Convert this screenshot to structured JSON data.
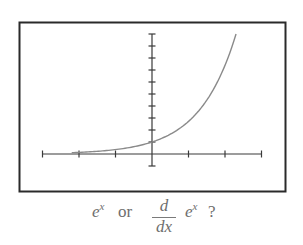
{
  "chart_data": {
    "type": "line",
    "title": "",
    "xlabel": "",
    "ylabel": "",
    "function": "y = e^x",
    "series": [
      {
        "name": "e^x",
        "x": [
          -3,
          -2,
          -1,
          -0.5,
          0,
          0.5,
          1,
          1.5,
          2,
          2.3
        ],
        "y": [
          0.05,
          0.14,
          0.37,
          0.61,
          1.0,
          1.65,
          2.72,
          4.48,
          7.39,
          10.0
        ]
      }
    ],
    "xlim": [
      -3,
      3
    ],
    "ylim": [
      -1,
      10
    ],
    "x_ticks": [
      -3,
      -2,
      -1,
      0,
      1,
      2,
      3
    ],
    "y_ticks": [
      -1,
      0,
      1,
      2,
      3,
      4,
      5,
      6,
      7,
      8,
      9,
      10
    ],
    "grid": false,
    "legend": "none",
    "colors": {
      "curve": "#8a8a8a",
      "axes": "#3a3a3a",
      "frame": "#2a2a2a"
    }
  },
  "caption": {
    "term1_base": "e",
    "term1_exp": "x",
    "connector": "or",
    "frac_num": "d",
    "frac_den": "dx",
    "term2_base": "e",
    "term2_exp": "x",
    "question_mark": "?"
  }
}
